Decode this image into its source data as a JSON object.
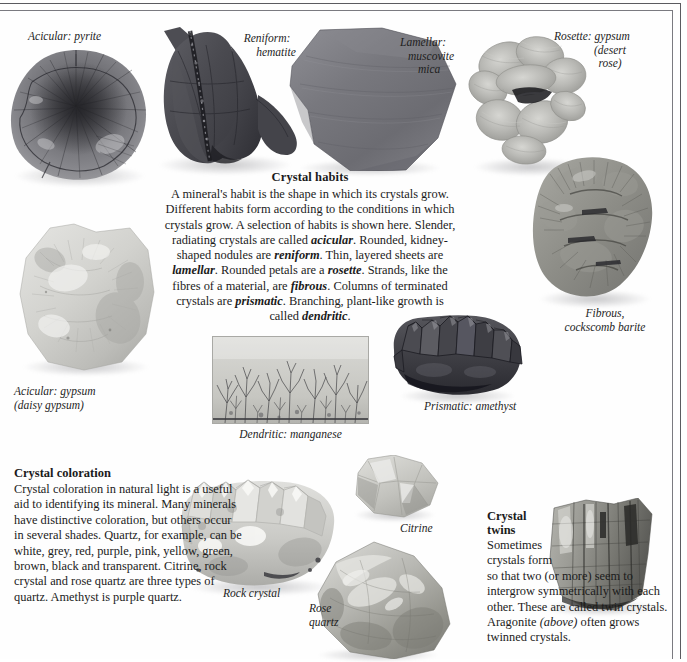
{
  "captions": {
    "acicular_pyrite": "Acicular: pyrite",
    "reniform_hematite_l1": "Reniform:",
    "reniform_hematite_l2": "hematite",
    "lamellar_l1": "Lamellar:",
    "lamellar_l2": "muscovite",
    "lamellar_l3": "mica",
    "rosette_l1": "Rosette: gypsum",
    "rosette_l2": "(desert",
    "rosette_l3": "rose)",
    "fibrous_l1": "Fibrous,",
    "fibrous_l2": "cockscomb barite",
    "acicular_gypsum_l1": "Acicular: gypsum",
    "acicular_gypsum_l2": "(daisy gypsum)",
    "dendritic_manganese": "Dendritic: manganese",
    "prismatic_amethyst": "Prismatic: amethyst",
    "citrine": "Citrine",
    "rock_crystal": "Rock crystal",
    "rose_quartz_l1": "Rose",
    "rose_quartz_l2": "quartz"
  },
  "habits": {
    "heading": "Crystal habits",
    "body_runs": [
      {
        "t": "A mineral's habit is the shape in which its crystals grow. Different habits form according to the conditions in which crystals grow. A selection of habits is shown here. Slender, radiating crystals are called ",
        "s": "normal"
      },
      {
        "t": "acicular",
        "s": "bolditalic"
      },
      {
        "t": ". Rounded, kidney-shaped nodules are ",
        "s": "normal"
      },
      {
        "t": "reniform",
        "s": "bolditalic"
      },
      {
        "t": ". Thin, layered sheets are ",
        "s": "normal"
      },
      {
        "t": "lamellar",
        "s": "bolditalic"
      },
      {
        "t": ". Rounded petals are a ",
        "s": "normal"
      },
      {
        "t": "rosette",
        "s": "bolditalic"
      },
      {
        "t": ". Strands, like the fibres of a material, are ",
        "s": "normal"
      },
      {
        "t": "fibrous",
        "s": "bolditalic"
      },
      {
        "t": ". Columns of terminated crystals are ",
        "s": "normal"
      },
      {
        "t": "prismatic",
        "s": "bolditalic"
      },
      {
        "t": ". Branching, plant-like growth is called ",
        "s": "normal"
      },
      {
        "t": "dendritic",
        "s": "bolditalic"
      },
      {
        "t": ".",
        "s": "normal"
      }
    ]
  },
  "coloration": {
    "heading": "Crystal coloration",
    "body": "Crystal coloration in natural light is a useful aid to identifying its mineral. Many minerals have distinctive coloration, but others occur in several shades. Quartz, for example, can be white, grey, red, purple, pink, yellow, green, brown, black and transparent. Citrine, rock crystal and rose quartz are three types of quartz. Amethyst is purple quartz."
  },
  "twins": {
    "heading_l1": "Crystal",
    "heading_l2": "twins",
    "body_narrow": "Sometimes crystals form",
    "body_runs": [
      {
        "t": "so that two (or more) seem to intergrow symmetrically with each other. These are called twin crystals. Aragonite ",
        "s": "normal"
      },
      {
        "t": "(above)",
        "s": "italic"
      },
      {
        "t": " often grows twinned crystals.",
        "s": "normal"
      }
    ]
  },
  "specimens": [
    {
      "name": "pyrite-nodule",
      "label": "Acicular: pyrite"
    },
    {
      "name": "hematite-nodule",
      "label": "Reniform: hematite"
    },
    {
      "name": "muscovite-mica-sheet",
      "label": "Lamellar: muscovite mica"
    },
    {
      "name": "desert-rose-gypsum",
      "label": "Rosette: gypsum (desert rose)"
    },
    {
      "name": "cockscomb-barite",
      "label": "Fibrous, cockscomb barite"
    },
    {
      "name": "daisy-gypsum",
      "label": "Acicular: gypsum (daisy gypsum)"
    },
    {
      "name": "dendritic-manganese",
      "label": "Dendritic: manganese"
    },
    {
      "name": "amethyst-cluster",
      "label": "Prismatic: amethyst"
    },
    {
      "name": "rock-crystal-cluster",
      "label": "Rock crystal"
    },
    {
      "name": "citrine-crystal",
      "label": "Citrine"
    },
    {
      "name": "rose-quartz-pebble",
      "label": "Rose quartz"
    },
    {
      "name": "aragonite-twin",
      "label": "Aragonite twin"
    }
  ],
  "colors": {
    "paper": "#fefefe",
    "ink": "#1b1b1b",
    "rule_outer": "#5a5a5f",
    "rule_inner": "#7a7a80",
    "hematite_dark": "#4a4a50",
    "amethyst_dark": "#3a3a40",
    "gypsum_light": "#cfcfca"
  }
}
